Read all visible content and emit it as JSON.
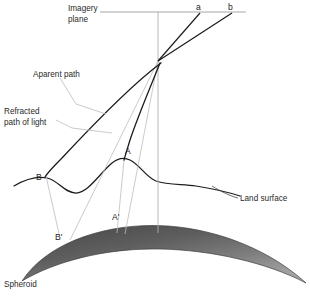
{
  "figure": {
    "title_visible": false,
    "background_color": "#ffffff",
    "labels": {
      "imagery_plane_line1": "Imagery",
      "imagery_plane_line2": "plane",
      "apparent_path": "Aparent path",
      "refracted_line1": "Refracted",
      "refracted_line2": "path of light",
      "land_surface": "Land surface",
      "spheroid": "Spheroid",
      "ray_a": "a",
      "ray_b": "b",
      "point_a": "A",
      "point_a_prime": "A'",
      "point_b": "B",
      "point_b_prime": "B'"
    },
    "colors": {
      "ink": "#1c1c1c",
      "text": "#2b2b2b",
      "thin_gray": "#b5b5b5",
      "leader_gray": "#b9b9b9",
      "spheroid_dark": "#4a4a4a",
      "spheroid_light": "#9a9a9a",
      "spheroid_edge": "#3a3a3a",
      "plane_line": "#9c9c9c"
    },
    "geometry": {
      "imagery_plane_y": 12,
      "imagery_plane_x_start": 100,
      "imagery_plane_x_end": 246,
      "vertical_axis_x": 158,
      "vertical_axis_y_top": 12,
      "vertical_axis_y_bottom": 233,
      "perspective_center_x": 158,
      "perspective_center_y": 61,
      "ray_a_endpoint_x": 200,
      "ray_b_endpoint_x": 232
    }
  }
}
